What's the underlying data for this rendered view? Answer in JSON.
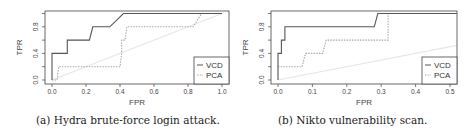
{
  "chart_data": [
    {
      "type": "line",
      "title": "",
      "caption": "(a) Hydra brute-force login attack.",
      "xlabel": "FPR",
      "ylabel": "TPR",
      "xlim": [
        0,
        1.0
      ],
      "ylim": [
        0,
        1.0
      ],
      "xticks": [
        "0.0",
        "0.2",
        "0.4",
        "0.6",
        "0.8",
        "1.0"
      ],
      "yticks": [
        "0.0",
        "0.4",
        "0.8"
      ],
      "grid": false,
      "legend_position": "bottom-right",
      "legend": [
        "VCD",
        "PCA"
      ],
      "series": [
        {
          "name": "VCD",
          "style": "solid",
          "color": "#555555",
          "points": [
            [
              0,
              0
            ],
            [
              0,
              0.4
            ],
            [
              0.09,
              0.4
            ],
            [
              0.09,
              0.6
            ],
            [
              0.22,
              0.6
            ],
            [
              0.24,
              0.8
            ],
            [
              0.34,
              0.8
            ],
            [
              0.42,
              1.0
            ],
            [
              1.0,
              1.0
            ]
          ]
        },
        {
          "name": "PCA",
          "style": "dotted",
          "color": "#aaaaaa",
          "points": [
            [
              0,
              0
            ],
            [
              0.03,
              0
            ],
            [
              0.04,
              0.2
            ],
            [
              0.4,
              0.2
            ],
            [
              0.41,
              0.4
            ],
            [
              0.41,
              0.6
            ],
            [
              0.43,
              0.6
            ],
            [
              0.44,
              0.8
            ],
            [
              0.83,
              0.8
            ],
            [
              0.88,
              1.0
            ],
            [
              1.0,
              1.0
            ]
          ]
        },
        {
          "name": "random",
          "style": "solid",
          "color": "#e6e6e6",
          "points": [
            [
              0,
              0
            ],
            [
              1.0,
              1.0
            ]
          ]
        }
      ]
    },
    {
      "type": "line",
      "title": "",
      "caption": "(b) Nikto vulnerability scan.",
      "xlabel": "FPR",
      "ylabel": "TPR",
      "xlim": [
        0,
        0.52
      ],
      "ylim": [
        0,
        1.0
      ],
      "xticks": [
        "0.0",
        "0.1",
        "0.2",
        "0.3",
        "0.4",
        "0.5"
      ],
      "yticks": [
        "0.0",
        "0.4",
        "0.8"
      ],
      "grid": false,
      "legend_position": "bottom-right",
      "legend": [
        "VCD",
        "PCA"
      ],
      "series": [
        {
          "name": "VCD",
          "style": "solid",
          "color": "#555555",
          "points": [
            [
              0,
              0
            ],
            [
              0,
              0.4
            ],
            [
              0.01,
              0.4
            ],
            [
              0.01,
              0.6
            ],
            [
              0.02,
              0.6
            ],
            [
              0.02,
              0.8
            ],
            [
              0.28,
              0.8
            ],
            [
              0.29,
              1.0
            ],
            [
              0.52,
              1.0
            ]
          ]
        },
        {
          "name": "PCA",
          "style": "dotted",
          "color": "#aaaaaa",
          "points": [
            [
              0,
              0.2
            ],
            [
              0.07,
              0.2
            ],
            [
              0.08,
              0.4
            ],
            [
              0.13,
              0.4
            ],
            [
              0.14,
              0.6
            ],
            [
              0.32,
              0.6
            ],
            [
              0.32,
              1.0
            ],
            [
              0.52,
              1.0
            ]
          ]
        },
        {
          "name": "random",
          "style": "solid",
          "color": "#e6e6e6",
          "points": [
            [
              0,
              0
            ],
            [
              0.52,
              0.52
            ]
          ]
        }
      ]
    }
  ]
}
